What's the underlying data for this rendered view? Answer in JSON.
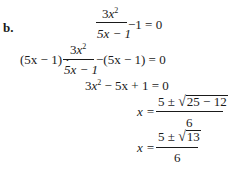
{
  "problem_label": "b.",
  "steps": [
    {
      "lhs_fraction": {
        "num_coef": "3",
        "num_var": "x",
        "num_exp": "2",
        "den": "5x − 1"
      },
      "rest": "−1 = 0"
    },
    {
      "prefix": "(5x − 1) · ",
      "lhs_fraction": {
        "num_coef": "3",
        "num_var": "x",
        "num_exp": "2",
        "den": "5x − 1"
      },
      "rest": "−(5x − 1) = 0"
    },
    {
      "coef": "3",
      "var": "x",
      "exp": "2",
      "rest": " − 5x + 1 = 0"
    },
    {
      "lhs": "x =",
      "num_pre": "5 ± ",
      "radicand": "25 − 12",
      "den": "6"
    },
    {
      "lhs": "x =",
      "num_pre": "5 ± ",
      "radicand": "13",
      "den": "6"
    }
  ]
}
